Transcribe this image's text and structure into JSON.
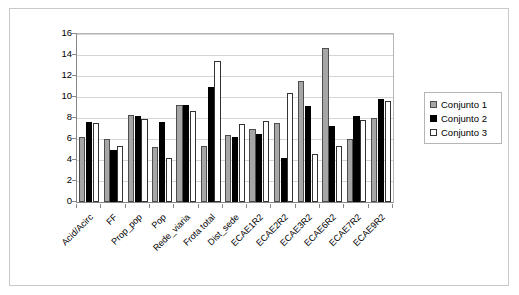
{
  "chart_data": {
    "type": "bar",
    "title": "",
    "xlabel": "",
    "ylabel": "",
    "ylim": [
      0,
      16
    ],
    "yticks": [
      0,
      2,
      4,
      6,
      8,
      10,
      12,
      14,
      16
    ],
    "grid": true,
    "legend_position": "right",
    "categories": [
      "Acid/Acirc",
      "FF",
      "Prop_pop",
      "Pop",
      "Rede_viaria",
      "Frota total",
      "Dist_sede",
      "ECAE1R2",
      "ECAE2R2",
      "ECAE3R2",
      "ECAE6R2",
      "ECAE7R2",
      "ECAE9R2"
    ],
    "series": [
      {
        "name": "Conjunto 1",
        "color": "#a6a6a6",
        "values": [
          6.2,
          6.0,
          8.3,
          5.2,
          9.2,
          5.3,
          6.4,
          7.0,
          7.5,
          11.5,
          14.7,
          6.0,
          8.0
        ]
      },
      {
        "name": "Conjunto 2",
        "color": "#000000",
        "values": [
          7.6,
          5.0,
          8.2,
          7.6,
          9.2,
          11.0,
          6.2,
          6.5,
          4.2,
          9.1,
          7.2,
          8.2,
          9.8
        ]
      },
      {
        "name": "Conjunto 3",
        "color": "#ffffff",
        "values": [
          7.5,
          5.3,
          7.9,
          4.2,
          8.7,
          13.4,
          7.4,
          7.7,
          10.4,
          4.6,
          5.3,
          7.8,
          9.6
        ]
      }
    ]
  },
  "legend": {
    "entries": [
      {
        "label": "Conjunto 1"
      },
      {
        "label": "Conjunto 2"
      },
      {
        "label": "Conjunto 3"
      }
    ]
  }
}
